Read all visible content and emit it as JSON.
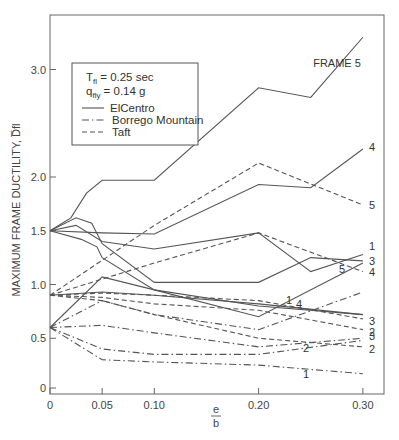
{
  "chart_data": {
    "type": "line",
    "title": "",
    "xlabel_num": "e",
    "xlabel_den": "b",
    "ylabel": "MAXIMUM FRAME DUCTILITY, D̅fl",
    "xlim": [
      0,
      0.32
    ],
    "ylim": [
      0,
      3.4
    ],
    "xticks": [
      {
        "value": 0,
        "label": "0"
      },
      {
        "value": 0.05,
        "label": "0.05"
      },
      {
        "value": 0.1,
        "label": "0.10"
      },
      {
        "value": 0.2,
        "label": "0.20"
      },
      {
        "value": 0.3,
        "label": "0.30"
      }
    ],
    "yticks": [
      {
        "value": 0,
        "label": "0"
      },
      {
        "value": 0.5,
        "label": "0.5"
      },
      {
        "value": 1.0,
        "label": "1.0"
      },
      {
        "value": 1.5,
        "label": "1.5"
      },
      {
        "value": 2.0,
        "label": "2.0"
      },
      {
        "value": 3.0,
        "label": "3.0"
      }
    ],
    "grid": false,
    "annotation": {
      "line1_main": "T",
      "line1_sub": "fl",
      "line1_rest": " = 0.25 sec",
      "line2_main": "q",
      "line2_sub": "fly",
      "line2_rest": " = 0.14 g"
    },
    "legend": [
      {
        "name": "ElCentro",
        "style": "solid"
      },
      {
        "name": "Borrego Mountain",
        "style": "dashdot"
      },
      {
        "name": "Taft",
        "style": "dashed"
      }
    ],
    "series": [
      {
        "name": "ElCentro Frame 5",
        "record": "ElCentro",
        "style": "solid",
        "end_label": "FRAME 5",
        "x": [
          0,
          0.02,
          0.035,
          0.05,
          0.1,
          0.2,
          0.25,
          0.3
        ],
        "y": [
          1.5,
          1.62,
          1.85,
          1.97,
          1.97,
          2.83,
          2.74,
          3.3
        ]
      },
      {
        "name": "ElCentro Frame 4",
        "record": "ElCentro",
        "style": "solid",
        "end_label": "4",
        "x": [
          0,
          0.05,
          0.1,
          0.2,
          0.25,
          0.3
        ],
        "y": [
          1.5,
          1.48,
          1.47,
          1.93,
          1.9,
          2.26
        ]
      },
      {
        "name": "ElCentro Frame 1",
        "record": "ElCentro",
        "style": "solid",
        "end_label": "1",
        "x": [
          0,
          0.025,
          0.05,
          0.1,
          0.2,
          0.25,
          0.3
        ],
        "y": [
          1.5,
          1.55,
          1.4,
          1.33,
          1.48,
          1.12,
          1.28
        ]
      },
      {
        "name": "ElCentro Frame 3",
        "record": "ElCentro",
        "style": "solid",
        "end_label": "3",
        "x": [
          0,
          0.025,
          0.04,
          0.05,
          0.1,
          0.2,
          0.25,
          0.3
        ],
        "y": [
          1.5,
          1.62,
          1.57,
          1.38,
          1.02,
          1.02,
          1.25,
          1.22
        ]
      },
      {
        "name": "ElCentro Frame 2",
        "record": "ElCentro",
        "style": "solid",
        "end_label": "",
        "x": [
          0,
          0.03,
          0.045,
          0.05,
          0.1,
          0.2,
          0.3
        ],
        "y": [
          1.5,
          1.42,
          1.35,
          1.25,
          0.95,
          0.8,
          0.72
        ]
      },
      {
        "name": "ElCentro Frame 5 (low)",
        "record": "ElCentro",
        "style": "solid",
        "end_label": "5",
        "x": [
          0,
          0.05,
          0.1,
          0.2,
          0.3
        ],
        "y": [
          0.6,
          1.07,
          0.95,
          0.7,
          1.2
        ]
      },
      {
        "name": "ElCentro Frame 1 (low)",
        "record": "ElCentro",
        "style": "solid",
        "end_label": "1",
        "x": [
          0,
          0.05,
          0.1,
          0.2,
          0.3
        ],
        "y": [
          0.9,
          0.93,
          0.9,
          0.82,
          0.72
        ]
      },
      {
        "name": "Taft Frame 5",
        "record": "Taft",
        "style": "dashed",
        "end_label": "5",
        "x": [
          0,
          0.1,
          0.2,
          0.3
        ],
        "y": [
          0.9,
          1.55,
          2.13,
          1.74
        ]
      },
      {
        "name": "Taft Frame 4",
        "record": "Taft",
        "style": "dashed",
        "end_label": "4",
        "x": [
          0,
          0.05,
          0.1,
          0.2,
          0.3
        ],
        "y": [
          0.9,
          1.05,
          1.2,
          1.48,
          1.12
        ]
      },
      {
        "name": "Taft Frame 3",
        "record": "Taft",
        "style": "dashed",
        "end_label": "3",
        "x": [
          0,
          0.05,
          0.1,
          0.2,
          0.3
        ],
        "y": [
          0.9,
          0.92,
          0.9,
          0.85,
          0.68
        ]
      },
      {
        "name": "Taft Frame 2",
        "record": "Taft",
        "style": "dashed",
        "end_label": "2",
        "x": [
          0,
          0.05,
          0.1,
          0.2,
          0.3
        ],
        "y": [
          0.9,
          0.88,
          0.82,
          0.76,
          0.58
        ]
      },
      {
        "name": "Taft Frame 2 (low)",
        "record": "Taft",
        "style": "dashed",
        "end_label": "2",
        "x": [
          0,
          0.05,
          0.1,
          0.2,
          0.3
        ],
        "y": [
          0.9,
          0.85,
          0.72,
          0.5,
          0.42
        ]
      },
      {
        "name": "Borrego Frame 4",
        "record": "Borrego Mountain",
        "style": "dashdot",
        "end_label": "4",
        "x": [
          0,
          0.05,
          0.1,
          0.2,
          0.3
        ],
        "y": [
          0.6,
          0.85,
          0.72,
          0.58,
          0.93
        ]
      },
      {
        "name": "Borrego Frame 3",
        "record": "Borrego Mountain",
        "style": "dashdot",
        "end_label": "3",
        "x": [
          0,
          0.05,
          0.1,
          0.2,
          0.3
        ],
        "y": [
          0.6,
          0.62,
          0.55,
          0.42,
          0.5
        ]
      },
      {
        "name": "Borrego Frame 2",
        "record": "Borrego Mountain",
        "style": "dashdot",
        "end_label": "2",
        "x": [
          0,
          0.05,
          0.1,
          0.2,
          0.3
        ],
        "y": [
          0.6,
          0.4,
          0.35,
          0.35,
          0.48
        ]
      },
      {
        "name": "Borrego Frame 1",
        "record": "Borrego Mountain",
        "style": "dashdot",
        "end_label": "1",
        "x": [
          0,
          0.05,
          0.1,
          0.2,
          0.3
        ],
        "y": [
          0.6,
          0.3,
          0.28,
          0.25,
          0.17
        ]
      }
    ]
  }
}
